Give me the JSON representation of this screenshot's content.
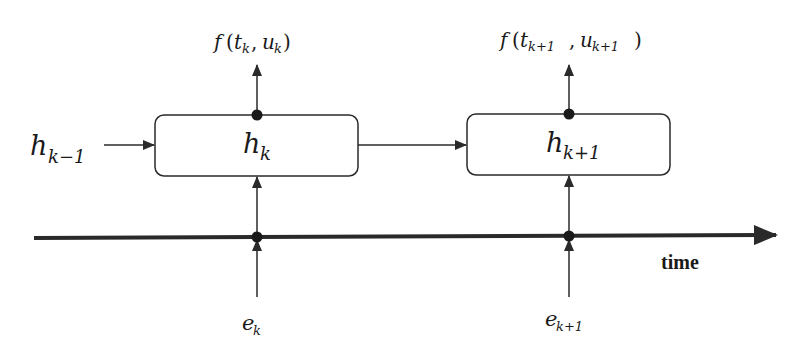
{
  "diagram": {
    "colors": {
      "stroke": "#2a2a2a",
      "background": "#ffffff"
    },
    "input_state": {
      "base": "h",
      "sub": "k−1"
    },
    "cells": [
      {
        "label": {
          "base": "h",
          "sub": "k"
        },
        "output": {
          "f": "f",
          "open": "(",
          "t": "t",
          "t_sub": "k",
          "comma": ",",
          "u": "u",
          "u_sub": "k",
          "close": ")"
        },
        "event": {
          "base": "e",
          "sub": "k"
        }
      },
      {
        "label": {
          "base": "h",
          "sub": "k+1"
        },
        "output": {
          "f": "f",
          "open": "(",
          "t": "t",
          "t_sub": "k+1",
          "comma": ",",
          "u": "u",
          "u_sub": "k+1",
          "close": ")"
        },
        "event": {
          "base": "e",
          "sub": "k+1"
        }
      }
    ],
    "axis": {
      "label": "time"
    }
  }
}
